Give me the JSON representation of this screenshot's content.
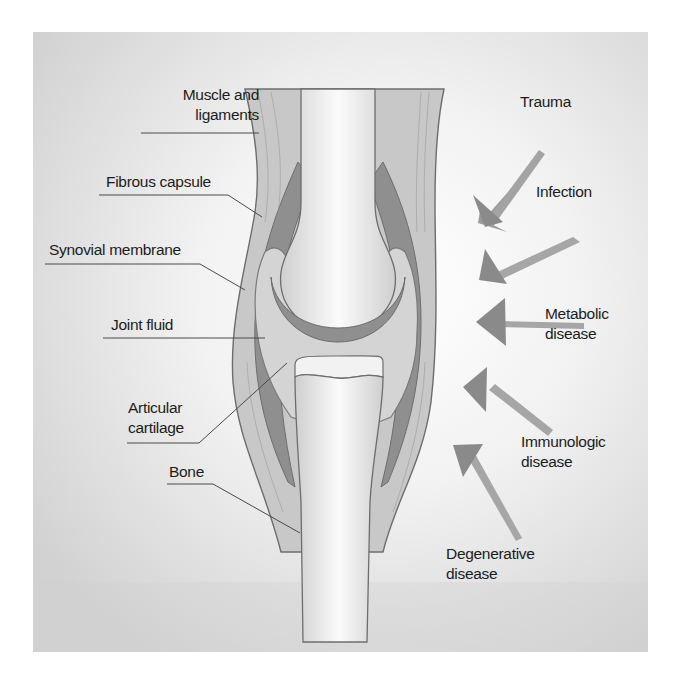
{
  "diagram": {
    "type": "anatomical-cross-section",
    "colors": {
      "background_light": "#ffffff",
      "background_dark": "#d4d4d4",
      "soft_tissue": "#c9c9c9",
      "capsule_dark": "#8e8e8e",
      "bone": "#d8d8d8",
      "bone_highlight": "#fafafa",
      "arrow": "#8a8a8a",
      "outline": "#6a6a6a",
      "text": "#1c1c1c"
    },
    "anatomy_labels": [
      {
        "id": "muscle",
        "lines": [
          "Muscle and",
          "ligaments"
        ]
      },
      {
        "id": "capsule",
        "lines": [
          "Fibrous capsule"
        ]
      },
      {
        "id": "synovial",
        "lines": [
          "Synovial membrane"
        ]
      },
      {
        "id": "fluid",
        "lines": [
          "Joint fluid"
        ]
      },
      {
        "id": "cartilage",
        "lines": [
          "Articular",
          "cartilage"
        ]
      },
      {
        "id": "bone",
        "lines": [
          "Bone"
        ]
      }
    ],
    "cause_labels": [
      {
        "id": "trauma",
        "lines": [
          "Trauma"
        ]
      },
      {
        "id": "infection",
        "lines": [
          "Infection"
        ]
      },
      {
        "id": "metabolic",
        "lines": [
          "Metabolic",
          "disease"
        ]
      },
      {
        "id": "immunologic",
        "lines": [
          "Immunologic",
          "disease"
        ]
      },
      {
        "id": "degenerative",
        "lines": [
          "Degenerative",
          "disease"
        ]
      }
    ]
  }
}
